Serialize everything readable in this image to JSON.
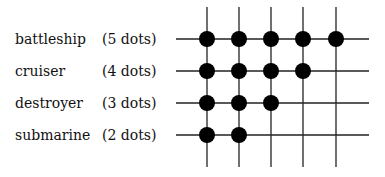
{
  "ships": [
    {
      "name": "battleship",
      "count_label": "(5 dots)",
      "dots": 5
    },
    {
      "name": "cruiser",
      "count_label": "(4 dots)",
      "dots": 4
    },
    {
      "name": "destroyer",
      "count_label": "(3 dots)",
      "dots": 3
    },
    {
      "name": "submarine",
      "count_label": "(2 dots)",
      "dots": 2
    }
  ],
  "grid": {
    "columns": 5,
    "rows": 4,
    "line_color": "#222222",
    "dot_color": "#000000"
  }
}
